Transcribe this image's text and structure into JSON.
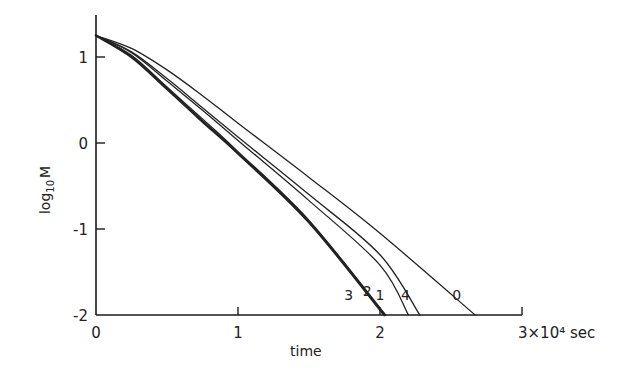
{
  "chart_data": {
    "type": "line",
    "title": "",
    "xlabel": "time",
    "ylabel": "log10 M",
    "ylabel_parts": {
      "base": "log",
      "sub": "10",
      "var": "M"
    },
    "x_unit_label": "3×10⁴ sec",
    "xlim": [
      0,
      3
    ],
    "ylim": [
      -2,
      1.4
    ],
    "x_ticks": [
      0,
      1,
      2,
      3
    ],
    "x_tick_labels": [
      "0",
      "1",
      "2",
      "3×10⁴ sec"
    ],
    "y_ticks": [
      -2,
      -1,
      0,
      1
    ],
    "y_tick_labels": [
      "-2",
      "-1",
      "0",
      "1"
    ],
    "grid": false,
    "legend": "inline curve labels near x-axis",
    "series": [
      {
        "name": "0",
        "label": "0",
        "thick": false,
        "x": [
          0,
          0.25,
          0.5,
          0.75,
          1.0,
          1.5,
          2.0,
          2.67
        ],
        "y": [
          1.25,
          1.1,
          0.85,
          0.55,
          0.23,
          -0.4,
          -1.05,
          -2.0
        ]
      },
      {
        "name": "1",
        "label": "1",
        "thick": false,
        "x": [
          0,
          0.25,
          0.5,
          0.75,
          1.0,
          1.5,
          2.0,
          2.2
        ],
        "y": [
          1.25,
          1.05,
          0.72,
          0.38,
          0.03,
          -0.67,
          -1.42,
          -2.0
        ]
      },
      {
        "name": "2",
        "label": "2",
        "thick": false,
        "x": [
          0,
          0.25,
          0.5,
          0.75,
          1.0,
          1.5,
          2.04
        ],
        "y": [
          1.25,
          1.02,
          0.65,
          0.28,
          -0.1,
          -0.9,
          -2.0
        ]
      },
      {
        "name": "3",
        "label": "3",
        "thick": true,
        "x": [
          0,
          0.25,
          0.5,
          0.75,
          1.0,
          1.5,
          2.03
        ],
        "y": [
          1.25,
          1.0,
          0.63,
          0.25,
          -0.12,
          -0.92,
          -2.0
        ]
      },
      {
        "name": "4",
        "label": "4",
        "thick": false,
        "x": [
          0,
          0.25,
          0.5,
          0.75,
          1.0,
          1.5,
          2.0,
          2.28
        ],
        "y": [
          1.25,
          1.06,
          0.75,
          0.41,
          0.07,
          -0.6,
          -1.3,
          -2.0
        ]
      }
    ],
    "annotations": [
      {
        "text": "3",
        "x": 1.78,
        "y": -1.83
      },
      {
        "text": "2",
        "x": 1.91,
        "y": -1.78
      },
      {
        "text": "1",
        "x": 2.0,
        "y": -1.83
      },
      {
        "text": "4",
        "x": 2.18,
        "y": -1.83
      },
      {
        "text": "0",
        "x": 2.54,
        "y": -1.83
      }
    ]
  }
}
